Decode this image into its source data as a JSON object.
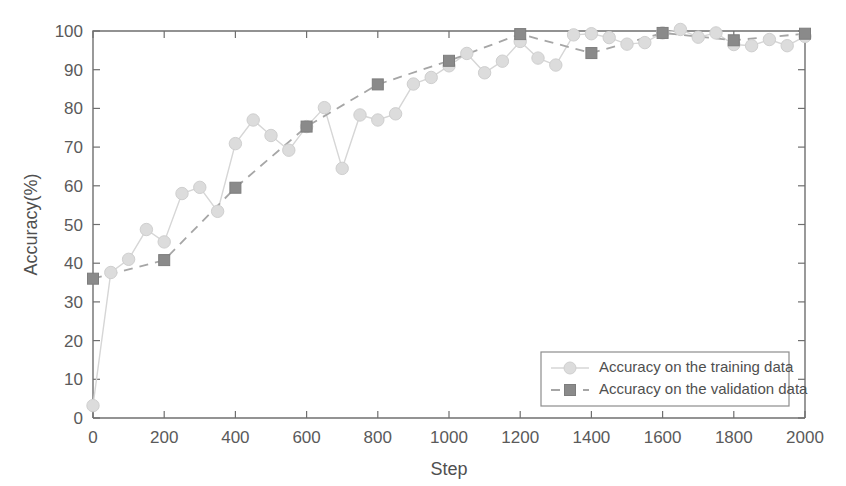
{
  "chart_data": {
    "type": "line",
    "title": "",
    "xlabel": "Step",
    "ylabel": "Accuracy(%)",
    "xlim": [
      0,
      2000
    ],
    "ylim": [
      0,
      100
    ],
    "xticks": [
      0,
      200,
      400,
      600,
      800,
      1000,
      1200,
      1400,
      1600,
      1800,
      2000
    ],
    "xtick_labels": [
      "0",
      "200",
      "400",
      "600",
      "800",
      "1000",
      "1200",
      "1400",
      "1600",
      "1800",
      "2000"
    ],
    "yticks": [
      0,
      10,
      20,
      30,
      40,
      50,
      60,
      70,
      80,
      90,
      100
    ],
    "ytick_labels": [
      "0",
      "10",
      "20",
      "30",
      "40",
      "50",
      "60",
      "70",
      "80",
      "90",
      "100"
    ],
    "grid": false,
    "legend_position": "lower-right",
    "series": [
      {
        "name": "Accuracy on the training data",
        "marker": "circle",
        "linestyle": "solid",
        "color": "#dcdcdc",
        "x": [
          0,
          50,
          100,
          150,
          200,
          250,
          300,
          350,
          400,
          450,
          500,
          550,
          600,
          650,
          700,
          750,
          800,
          850,
          900,
          950,
          1000,
          1050,
          1100,
          1150,
          1200,
          1250,
          1300,
          1350,
          1400,
          1450,
          1500,
          1550,
          1600,
          1650,
          1700,
          1750,
          1800,
          1850,
          1900,
          1950,
          2000
        ],
        "y": [
          3.2,
          37.6,
          41.0,
          48.7,
          45.5,
          58.0,
          59.6,
          53.4,
          70.9,
          77.0,
          73.0,
          69.2,
          75.3,
          80.2,
          64.5,
          78.3,
          77.0,
          78.6,
          86.3,
          88.0,
          91.0,
          94.2,
          89.2,
          92.2,
          97.3,
          93.0,
          91.2,
          99.0,
          99.3,
          98.3,
          96.6,
          97.0,
          99.5,
          100.4,
          98.4,
          99.5,
          96.5,
          96.2,
          97.8,
          96.2,
          98.6
        ]
      },
      {
        "name": "Accuracy on the validation data",
        "marker": "square",
        "linestyle": "dashed",
        "color": "#8a8a8a",
        "x": [
          0,
          200,
          400,
          600,
          800,
          1000,
          1200,
          1400,
          1600,
          1800,
          2000
        ],
        "y": [
          36.0,
          40.8,
          59.5,
          75.3,
          86.2,
          92.3,
          99.2,
          94.3,
          99.5,
          97.6,
          99.3
        ]
      }
    ]
  },
  "legend": {
    "entries": [
      {
        "label": "Accuracy on the training data"
      },
      {
        "label": "Accuracy on the validation data"
      }
    ]
  }
}
